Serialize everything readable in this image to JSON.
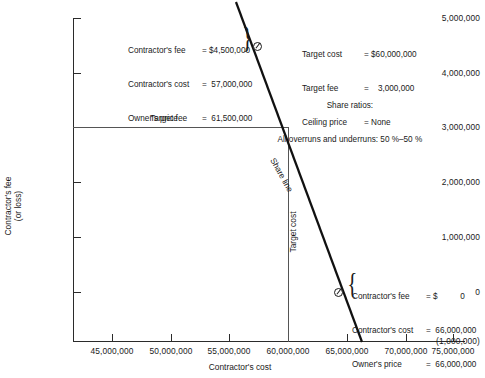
{
  "chart_data": {
    "type": "line",
    "title": "",
    "xlabel": "Contractor's cost",
    "ylabel": "Contractor's fee\n(or loss)",
    "xlim": [
      42500000,
      76500000
    ],
    "ylim": [
      -1000000,
      5000000
    ],
    "grid": false,
    "legend_position": "none",
    "x_ticks": [
      "45,000,000",
      "50,000,000",
      "55,000,000",
      "60,000,000",
      "65,000,000",
      "70,000,000",
      "75,000,000"
    ],
    "x_tick_values": [
      45000000,
      50000000,
      55000000,
      60000000,
      65000000,
      70000000,
      75000000
    ],
    "y_ticks": [
      "5,000,000",
      "4,000,000",
      "3,000,000",
      "2,000,000",
      "1,000,000",
      "0",
      "(1,000,000)"
    ],
    "y_tick_values": [
      5000000,
      4000000,
      3000000,
      2000000,
      1000000,
      0,
      -1000000
    ],
    "series": [
      {
        "name": "Share line",
        "x": [
          54000000,
          69000000
        ],
        "y": [
          6000000,
          -1000000
        ]
      }
    ],
    "reference_lines": [
      {
        "name": "Target fee",
        "orientation": "horizontal",
        "value": 3000000
      },
      {
        "name": "Target cost",
        "orientation": "vertical",
        "value": 60000000
      }
    ],
    "points": [
      {
        "label": "upper-point",
        "x": 57000000,
        "y": 4500000
      },
      {
        "label": "lower-point",
        "x": 66000000,
        "y": 0
      }
    ]
  },
  "axes": {
    "x_title": "Contractor's cost",
    "y_title_line1": "Contractor's fee",
    "y_title_line2": "(or loss)",
    "x_tick_labels": [
      "45,000,000",
      "50,000,000",
      "55,000,000",
      "60,000,000",
      "65,000,000",
      "70,000,000",
      "75,000,000"
    ],
    "y_tick_labels": [
      "5,000,000",
      "4,000,000",
      "3,000,000",
      "2,000,000",
      "1,000,000",
      "0",
      "(1,000,000)"
    ]
  },
  "labels": {
    "target_fee": "Target fee",
    "target_cost": "Target cost",
    "share_line": "Share line"
  },
  "annotations": {
    "upper_point": [
      {
        "label": "Contractor's fee",
        "eq": "= $4,500,000"
      },
      {
        "label": "Contractor's cost",
        "eq": "=  57,000,000"
      },
      {
        "label": "Owner's price",
        "eq": "=  61,500,000"
      }
    ],
    "lower_point": [
      {
        "label": "Contractor's fee",
        "eq": "= $          0"
      },
      {
        "label": "Contractor's cost",
        "eq": "=  66,000,000"
      },
      {
        "label": "Owner's price",
        "eq": "=  66,000,000"
      }
    ],
    "parameters": [
      {
        "label": "Target cost",
        "eq": "= $60,000,000"
      },
      {
        "label": "Target fee",
        "eq": "=    3,000,000"
      },
      {
        "label": "Ceiling price",
        "eq": "= None"
      }
    ],
    "share_ratios_title": "Share ratios:",
    "share_ratios_text": "All overruns and underruns: 50 %–50 %"
  }
}
